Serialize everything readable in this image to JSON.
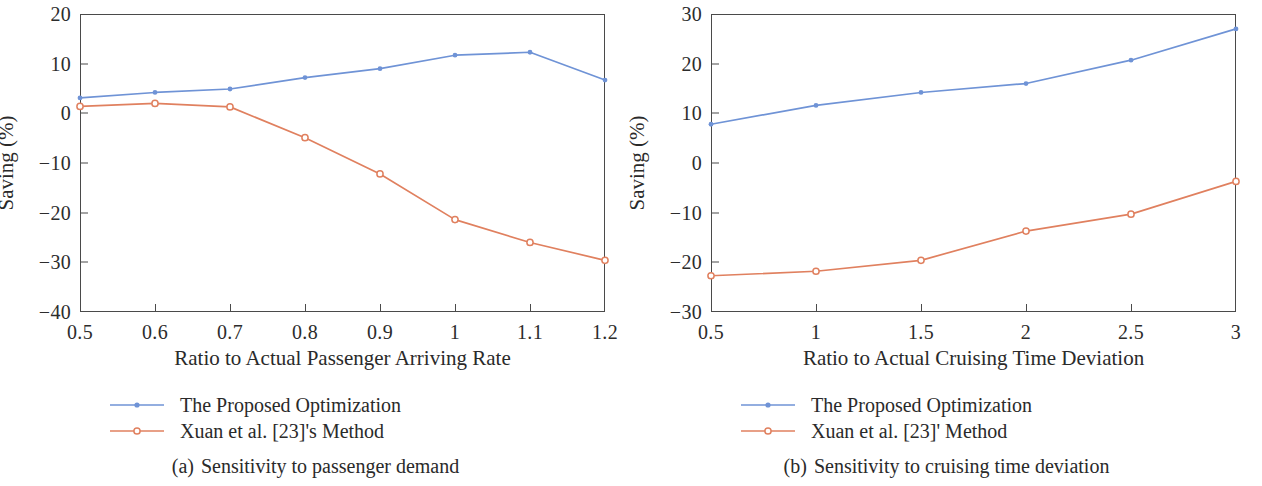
{
  "figure": {
    "colors": {
      "proposed": "#6f93d6",
      "xuan": "#e0805f",
      "axis": "#4a4a4a",
      "text": "#2a2a2a"
    }
  },
  "panels": [
    {
      "id": "a",
      "caption_tag": "(a)",
      "caption_text": "Sensitivity to passenger demand",
      "legend": [
        {
          "label": "The Proposed Optimization",
          "marker": "filled-dot",
          "color_key": "proposed"
        },
        {
          "label": "Xuan et al. [23]'s Method",
          "marker": "open-circle",
          "color_key": "xuan"
        }
      ],
      "chart_data": {
        "type": "line",
        "title": "",
        "xlabel": "Ratio to Actual Passenger Arriving Rate",
        "ylabel": "Saving (%)",
        "x": [
          0.5,
          0.6,
          0.7,
          0.8,
          0.9,
          1.0,
          1.1,
          1.2
        ],
        "xticks": [
          "0.5",
          "0.6",
          "0.7",
          "0.8",
          "0.9",
          "1",
          "1.1",
          "1.2"
        ],
        "yticks": [
          "20",
          "10",
          "0",
          "−10",
          "−20",
          "−30",
          "−40"
        ],
        "ytickvalues": [
          20,
          10,
          0,
          -10,
          -20,
          -30,
          -40
        ],
        "xlim": [
          0.5,
          1.2
        ],
        "ylim": [
          -40,
          20
        ],
        "grid": false,
        "legend_position": "below-plot",
        "series": [
          {
            "name": "The Proposed Optimization",
            "color": "#6f93d6",
            "marker": "filled-dot",
            "values": [
              3.1,
              4.2,
              4.9,
              7.2,
              9.0,
              11.7,
              12.3,
              6.7
            ]
          },
          {
            "name": "Xuan et al. [23]'s Method",
            "color": "#e0805f",
            "marker": "open-circle",
            "values": [
              1.4,
              2.0,
              1.3,
              -4.9,
              -12.2,
              -21.4,
              -26.0,
              -29.6
            ]
          }
        ]
      }
    },
    {
      "id": "b",
      "caption_tag": "(b)",
      "caption_text": "Sensitivity to cruising time deviation",
      "legend": [
        {
          "label": "The Proposed Optimization",
          "marker": "filled-dot",
          "color_key": "proposed"
        },
        {
          "label": "Xuan et al. [23]' Method",
          "marker": "open-circle",
          "color_key": "xuan"
        }
      ],
      "chart_data": {
        "type": "line",
        "title": "",
        "xlabel": "Ratio to Actual Cruising Time Deviation",
        "ylabel": "Saving (%)",
        "x": [
          0.5,
          1.0,
          1.5,
          2.0,
          2.5,
          3.0
        ],
        "xticks": [
          "0.5",
          "1",
          "1.5",
          "2",
          "2.5",
          "3"
        ],
        "yticks": [
          "30",
          "20",
          "10",
          "0",
          "−10",
          "−20",
          "−30"
        ],
        "ytickvalues": [
          30,
          20,
          10,
          0,
          -10,
          -20,
          -30
        ],
        "xlim": [
          0.5,
          3.0
        ],
        "ylim": [
          -30,
          30
        ],
        "grid": false,
        "legend_position": "below-plot",
        "series": [
          {
            "name": "The Proposed Optimization",
            "color": "#6f93d6",
            "marker": "filled-dot",
            "values": [
              7.8,
              11.6,
              14.2,
              16.0,
              20.7,
              27.0
            ]
          },
          {
            "name": "Xuan et al. [23]' Method",
            "color": "#e0805f",
            "marker": "open-circle",
            "values": [
              -22.7,
              -21.8,
              -19.6,
              -13.7,
              -10.3,
              -3.7
            ]
          }
        ]
      }
    }
  ]
}
